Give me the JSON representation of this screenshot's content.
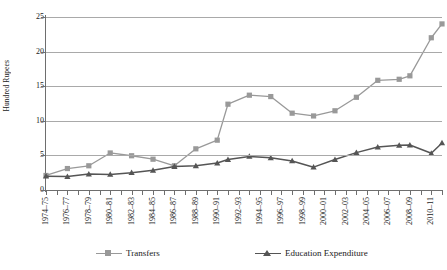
{
  "chart_data": {
    "type": "line",
    "title": "",
    "xlabel": "",
    "ylabel": "Hundred Rupees",
    "ylim": [
      0,
      25
    ],
    "yticks": [
      0,
      5,
      10,
      15,
      20,
      25
    ],
    "grid": true,
    "legend_position": "bottom",
    "categories": [
      "1974-75",
      "1975-76",
      "1976-77",
      "1977-78",
      "1978-79",
      "1979-80",
      "1980-81",
      "1981-82",
      "1982-83",
      "1983-84",
      "1984-85",
      "1985-86",
      "1986-87",
      "1987-88",
      "1988-89",
      "1989-90",
      "1990-91",
      "1991-92",
      "1992-93",
      "1993-94",
      "1994-95",
      "1995-96",
      "1996-97",
      "1997-98",
      "1998-99",
      "1999-00",
      "2000-01",
      "2001-02",
      "2002-03",
      "2003-04",
      "2004-05",
      "2005-06",
      "2006-07",
      "2007-08",
      "2008-09",
      "2009-10",
      "2010-11",
      "2011-12"
    ],
    "tick_labels": [
      "1974-75",
      "1976-77",
      "1978-79",
      "1980-81",
      "1982-83",
      "1984-85",
      "1986-87",
      "1988-89",
      "1990-91",
      "1992-93",
      "1994-95",
      "1996-97",
      "1998-99",
      "2000-01",
      "2002-03",
      "2004-05",
      "2006-07",
      "2008-09",
      "2010-11"
    ],
    "series": [
      {
        "name": "Transfers",
        "color": "#999999",
        "marker": "square",
        "x": [
          "1974-75",
          "1976-77",
          "1978-79",
          "1980-81",
          "1982-83",
          "1984-85",
          "1986-87",
          "1988-89",
          "1990-91",
          "1991-92",
          "1993-94",
          "1995-96",
          "1997-98",
          "1999-00",
          "2001-02",
          "2003-04",
          "2005-06",
          "2007-08",
          "2008-09",
          "2010-11",
          "2011-12"
        ],
        "values": [
          2.1,
          3.1,
          3.5,
          5.35,
          4.95,
          4.45,
          3.5,
          5.95,
          7.2,
          12.4,
          13.7,
          13.5,
          11.1,
          10.7,
          11.45,
          13.4,
          15.85,
          16.0,
          16.5,
          22.0,
          24.0
        ]
      },
      {
        "name": "Education Expenditure",
        "color": "#555555",
        "marker": "triangle",
        "x": [
          "1974-75",
          "1976-77",
          "1978-79",
          "1980-81",
          "1982-83",
          "1984-85",
          "1986-87",
          "1988-89",
          "1990-91",
          "1991-92",
          "1993-94",
          "1995-96",
          "1997-98",
          "1999-00",
          "2001-02",
          "2003-04",
          "2005-06",
          "2007-08",
          "2008-09",
          "2010-11",
          "2011-12"
        ],
        "values": [
          2.0,
          1.95,
          2.3,
          2.25,
          2.5,
          2.85,
          3.4,
          3.5,
          3.9,
          4.4,
          4.85,
          4.65,
          4.2,
          3.3,
          4.4,
          5.4,
          6.2,
          6.45,
          6.5,
          5.3,
          6.8
        ]
      }
    ]
  },
  "legend": {
    "items": [
      {
        "label": "Transfers"
      },
      {
        "label": "Education Expenditure"
      }
    ]
  }
}
